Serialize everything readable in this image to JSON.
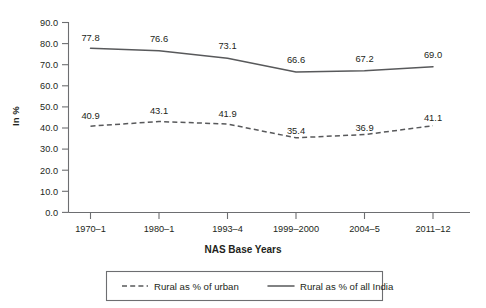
{
  "chart_data": {
    "type": "line",
    "title": "",
    "xlabel": "NAS Base Years",
    "ylabel": "In %",
    "categories": [
      "1970–1",
      "1980–1",
      "1993–4",
      "1999–2000",
      "2004–5",
      "2011–12"
    ],
    "ylim": [
      0.0,
      90.0
    ],
    "yticks": [
      "0.0",
      "10.0",
      "20.0",
      "30.0",
      "40.0",
      "50.0",
      "60.0",
      "70.0",
      "80.0",
      "90.0"
    ],
    "grid": false,
    "legend_position": "bottom",
    "series": [
      {
        "name": "Rural as % of urban",
        "style": "dashed",
        "values": [
          40.9,
          43.1,
          41.9,
          35.4,
          36.9,
          41.1
        ],
        "labels": [
          "40.9",
          "43.1",
          "41.9",
          "35.4",
          "36.9",
          "41.1"
        ]
      },
      {
        "name": "Rural as % of all India",
        "style": "solid",
        "values": [
          77.8,
          76.6,
          73.1,
          66.6,
          67.2,
          69.0
        ],
        "labels": [
          "77.8",
          "76.6",
          "73.1",
          "66.6",
          "67.2",
          "69.0"
        ]
      }
    ],
    "colors": {
      "line": "#58595b",
      "axis": "#6d6e71",
      "text": "#231f20",
      "background": "#ffffff"
    }
  },
  "legend": {
    "items": [
      {
        "label": "Rural as % of urban",
        "style": "dashed"
      },
      {
        "label": "Rural as % of all India",
        "style": "solid"
      }
    ]
  }
}
